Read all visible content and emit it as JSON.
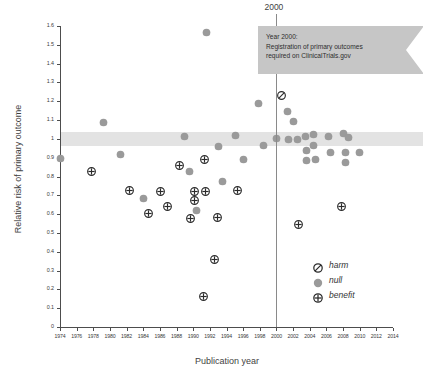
{
  "chart_data": {
    "type": "scatter",
    "title": "",
    "xlabel": "Publication year",
    "ylabel": "Relative risk of primary outcome",
    "xlim": [
      1974,
      2014
    ],
    "ylim": [
      0,
      1.6
    ],
    "grid": false,
    "legend_position": "inside-right",
    "xticks": [
      "1974",
      "1976",
      "1978",
      "1980",
      "1982",
      "1984",
      "1986",
      "1988",
      "1990",
      "1992",
      "1994",
      "1996",
      "1998",
      "2000",
      "2002",
      "2004",
      "2006",
      "2008",
      "2010",
      "2012",
      "2014"
    ],
    "yticks": [
      "0",
      "0.1",
      "0.2",
      "0.3",
      "0.4",
      "0.5",
      "0.6",
      "0.7",
      "0.8",
      "0.9",
      "1",
      "1.1",
      "1.2",
      "1.3",
      "1.4",
      "1.5",
      "1.6"
    ],
    "reference_line": {
      "x": 2000,
      "label": "2000"
    },
    "null_band": {
      "ymin": 0.96,
      "ymax": 1.035,
      "color": "#e3e3e3"
    },
    "annotation": {
      "lines": [
        "Year 2000:",
        "Registration of primary outcomes",
        "required on ClinicalTrials.gov"
      ],
      "shape": "ribbon-banner",
      "color": "#c6c6c6"
    },
    "legend": [
      {
        "key": "harm",
        "label": "harm",
        "marker": "circle-slash"
      },
      {
        "key": "null",
        "label": "null",
        "marker": "filled-dot"
      },
      {
        "key": "benefit",
        "label": "benefit",
        "marker": "circle-plus"
      }
    ],
    "marker_colors": {
      "null": "#9a9a9a",
      "benefit": "#2b2b2b",
      "harm": "#2b2b2b"
    },
    "series": [
      {
        "name": "null",
        "marker": "filled-dot",
        "points": [
          {
            "x": 1974.1,
            "y": 0.895
          },
          {
            "x": 1979.2,
            "y": 1.085
          },
          {
            "x": 1981.3,
            "y": 0.915
          },
          {
            "x": 1984.0,
            "y": 0.683
          },
          {
            "x": 1988.9,
            "y": 1.015
          },
          {
            "x": 1989.6,
            "y": 0.828
          },
          {
            "x": 1990.4,
            "y": 0.618
          },
          {
            "x": 1991.6,
            "y": 1.565
          },
          {
            "x": 1993.0,
            "y": 0.958
          },
          {
            "x": 1993.5,
            "y": 0.775
          },
          {
            "x": 1995.1,
            "y": 1.02
          },
          {
            "x": 1996.0,
            "y": 0.888
          },
          {
            "x": 1997.8,
            "y": 1.19
          },
          {
            "x": 1998.4,
            "y": 0.965
          },
          {
            "x": 2000.0,
            "y": 1.0
          },
          {
            "x": 2001.3,
            "y": 1.145
          },
          {
            "x": 2002.0,
            "y": 1.093
          },
          {
            "x": 2001.5,
            "y": 0.995
          },
          {
            "x": 2002.5,
            "y": 0.995
          },
          {
            "x": 2003.5,
            "y": 1.01
          },
          {
            "x": 2003.6,
            "y": 0.94
          },
          {
            "x": 2003.6,
            "y": 0.885
          },
          {
            "x": 2004.5,
            "y": 1.022
          },
          {
            "x": 2004.5,
            "y": 0.963
          },
          {
            "x": 2004.7,
            "y": 0.888
          },
          {
            "x": 2006.2,
            "y": 1.012
          },
          {
            "x": 2006.5,
            "y": 0.93
          },
          {
            "x": 2008.0,
            "y": 1.03
          },
          {
            "x": 2008.6,
            "y": 1.005
          },
          {
            "x": 2008.3,
            "y": 0.925
          },
          {
            "x": 2008.3,
            "y": 0.872
          },
          {
            "x": 2010.0,
            "y": 0.93
          }
        ]
      },
      {
        "name": "benefit",
        "marker": "circle-plus",
        "points": [
          {
            "x": 1977.8,
            "y": 0.828
          },
          {
            "x": 1982.3,
            "y": 0.728
          },
          {
            "x": 1984.6,
            "y": 0.605
          },
          {
            "x": 1986.1,
            "y": 0.72
          },
          {
            "x": 1986.9,
            "y": 0.64
          },
          {
            "x": 1988.3,
            "y": 0.86
          },
          {
            "x": 1989.7,
            "y": 0.575
          },
          {
            "x": 1990.2,
            "y": 0.722
          },
          {
            "x": 1990.2,
            "y": 0.672
          },
          {
            "x": 1991.4,
            "y": 0.893
          },
          {
            "x": 1991.5,
            "y": 0.718
          },
          {
            "x": 1992.9,
            "y": 0.58
          },
          {
            "x": 1992.6,
            "y": 0.36
          },
          {
            "x": 1991.2,
            "y": 0.16
          },
          {
            "x": 1995.3,
            "y": 0.723
          },
          {
            "x": 2002.7,
            "y": 0.545
          },
          {
            "x": 2007.8,
            "y": 0.638
          }
        ]
      },
      {
        "name": "harm",
        "marker": "circle-slash",
        "points": [
          {
            "x": 2000.6,
            "y": 1.228
          }
        ]
      }
    ]
  }
}
